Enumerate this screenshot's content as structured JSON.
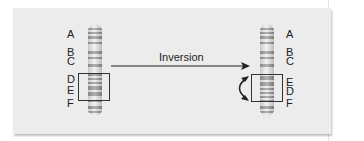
{
  "diagram": {
    "arrow_label": "Inversion",
    "left_chromosome": {
      "labels": [
        "A",
        "B",
        "C",
        "D",
        "E",
        "F"
      ],
      "boxed_segment": [
        "D",
        "E"
      ]
    },
    "right_chromosome": {
      "labels": [
        "A",
        "B",
        "C",
        "E",
        "D",
        "F"
      ],
      "boxed_segment": [
        "E",
        "D"
      ]
    },
    "colors": {
      "panel_background": "#ececec",
      "line": "#222222",
      "chromosome_light": "#f2f2f2",
      "chromosome_band": "#7a7a7a"
    }
  }
}
